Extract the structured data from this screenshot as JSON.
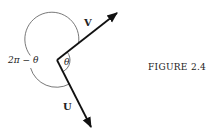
{
  "diagram": {
    "vectors": [
      {
        "name": "V",
        "label": "V",
        "from": [
          57,
          60
        ],
        "to": [
          117,
          13
        ]
      },
      {
        "name": "U",
        "label": "U",
        "from": [
          57,
          60
        ],
        "to": [
          91,
          127
        ]
      }
    ],
    "angles": {
      "inner_label": "θ",
      "outer_label": "2π − θ"
    },
    "caption": "FIGURE 2.4",
    "colors": {
      "ink": "#111111",
      "arc": "#555555",
      "background": "#ffffff"
    }
  }
}
